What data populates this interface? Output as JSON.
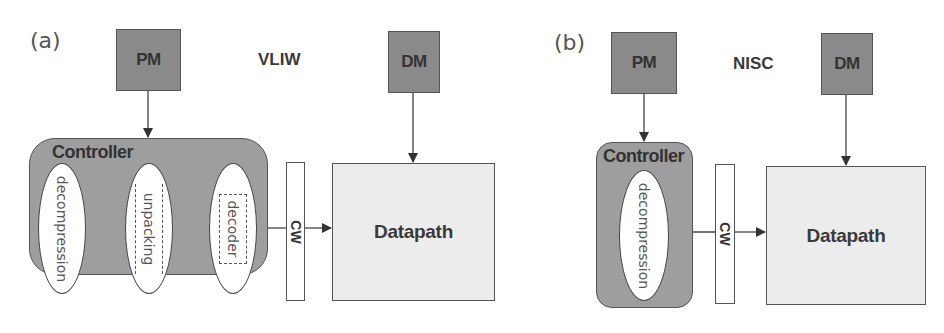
{
  "panels": [
    {
      "label": "(a)",
      "title": "VLIW",
      "program_memory": "PM",
      "data_memory": "DM",
      "controller": {
        "label": "Controller",
        "stages": [
          "decompression",
          "unpacking",
          "decoder"
        ]
      },
      "control_word": "CW",
      "datapath": "Datapath"
    },
    {
      "label": "(b)",
      "title": "NISC",
      "program_memory": "PM",
      "data_memory": "DM",
      "controller": {
        "label": "Controller",
        "stages": [
          "decompression"
        ]
      },
      "control_word": "CW",
      "datapath": "Datapath"
    }
  ],
  "colors": {
    "memory_block": "#8a8a8a",
    "controller": "#9e9e9e",
    "datapath": "#ececec",
    "stroke": "#444444"
  }
}
